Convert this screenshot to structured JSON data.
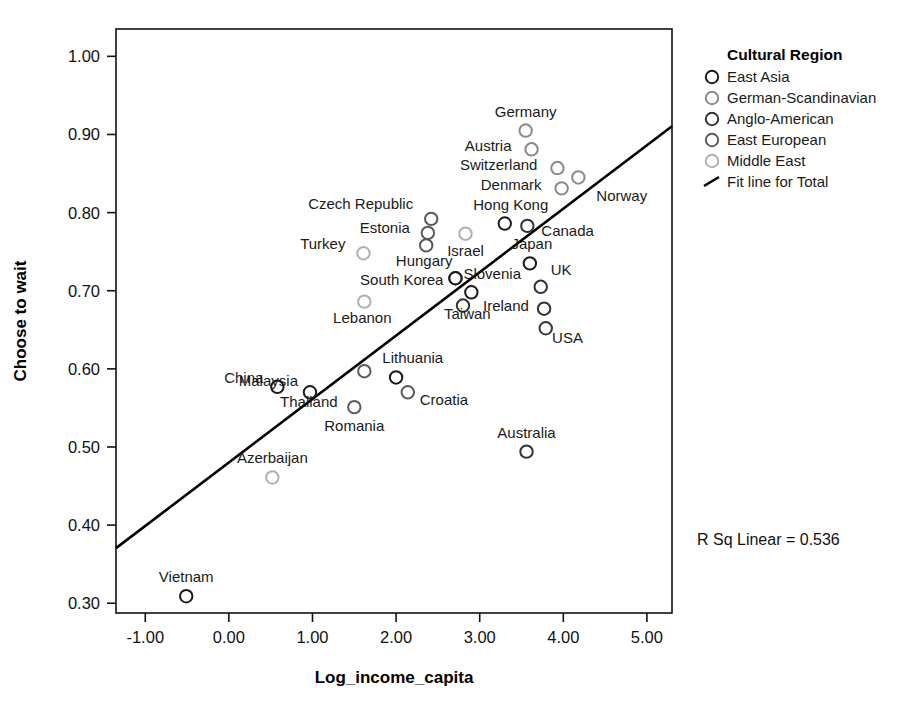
{
  "chart_data": {
    "type": "scatter",
    "title": "",
    "xlabel": "Log_income_capita",
    "ylabel": "Choose to wait",
    "xlim": [
      -1.35,
      5.3
    ],
    "ylim": [
      0.2875,
      1.035
    ],
    "xticks": [
      "-1.00",
      "0.00",
      "1.00",
      "2.00",
      "3.00",
      "4.00",
      "5.00"
    ],
    "xtick_values": [
      -1,
      0,
      1,
      2,
      3,
      4,
      5
    ],
    "yticks": [
      "0.30",
      "0.40",
      "0.50",
      "0.60",
      "0.70",
      "0.80",
      "0.90",
      "1.00"
    ],
    "ytick_values": [
      0.3,
      0.4,
      0.5,
      0.6,
      0.7,
      0.8,
      0.9,
      1.0
    ],
    "grid": false,
    "legend_position": "right",
    "annotation": "R Sq Linear = 0.536",
    "r_squared": 0.536,
    "fit_line": {
      "label": "Fit line for Total",
      "x_start": -1.35,
      "y_start": 0.3705,
      "x_end": 5.3,
      "y_end": 0.9105
    },
    "points": [
      {
        "label": "Germany",
        "x": 3.55,
        "y": 0.905,
        "group": "German-Scandinavian",
        "label_dx": 0,
        "label_dy": -14,
        "label_anchor": "middle"
      },
      {
        "label": "Austria",
        "x": 3.62,
        "y": 0.881,
        "group": "German-Scandinavian",
        "label_dx": -20,
        "label_dy": 2,
        "label_anchor": "end"
      },
      {
        "label": "Switzerland",
        "x": 3.93,
        "y": 0.857,
        "group": "German-Scandinavian",
        "label_dx": -20,
        "label_dy": 2,
        "label_anchor": "end"
      },
      {
        "label": "Norway",
        "x": 4.18,
        "y": 0.845,
        "group": "German-Scandinavian",
        "label_dx": 18,
        "label_dy": 24,
        "label_anchor": "start"
      },
      {
        "label": "Denmark",
        "x": 3.98,
        "y": 0.831,
        "group": "German-Scandinavian",
        "label_dx": -20,
        "label_dy": 2,
        "label_anchor": "end"
      },
      {
        "label": "Czech Republic",
        "x": 2.42,
        "y": 0.792,
        "group": "East European",
        "label_dx": -18,
        "label_dy": -10,
        "label_anchor": "end"
      },
      {
        "label": "Hong Kong",
        "x": 3.3,
        "y": 0.786,
        "group": "East Asia",
        "label_dx": 6,
        "label_dy": -14,
        "label_anchor": "middle"
      },
      {
        "label": "Canada",
        "x": 3.57,
        "y": 0.783,
        "group": "Anglo-American",
        "label_dx": 14,
        "label_dy": 10,
        "label_anchor": "start"
      },
      {
        "label": "Israel",
        "x": 2.83,
        "y": 0.773,
        "group": "Middle East",
        "label_dx": 0,
        "label_dy": 22,
        "label_anchor": "middle"
      },
      {
        "label": "Estonia",
        "x": 2.38,
        "y": 0.774,
        "group": "East European",
        "label_dx": -18,
        "label_dy": 0,
        "label_anchor": "end"
      },
      {
        "label": "Hungary",
        "x": 2.36,
        "y": 0.758,
        "group": "East European",
        "label_dx": -2,
        "label_dy": 21,
        "label_anchor": "middle"
      },
      {
        "label": "Turkey",
        "x": 1.61,
        "y": 0.748,
        "group": "Middle East",
        "label_dx": -18,
        "label_dy": -4,
        "label_anchor": "end"
      },
      {
        "label": "Japan",
        "x": 3.6,
        "y": 0.735,
        "group": "East Asia",
        "label_dx": 2,
        "label_dy": -14,
        "label_anchor": "middle"
      },
      {
        "label": "Slovenia",
        "x": 2.71,
        "y": 0.716,
        "group": "East European",
        "label_dx": 8,
        "label_dy": 1,
        "label_anchor": "start"
      },
      {
        "label": "South Korea",
        "x": 2.71,
        "y": 0.716,
        "group": "East Asia",
        "label_dx": -12,
        "label_dy": 7,
        "label_anchor": "end"
      },
      {
        "label": "UK",
        "x": 3.73,
        "y": 0.705,
        "group": "Anglo-American",
        "label_dx": 10,
        "label_dy": -12,
        "label_anchor": "start"
      },
      {
        "label": "Taiwan",
        "x": 2.9,
        "y": 0.698,
        "group": "East Asia",
        "label_dx": -4,
        "label_dy": 27,
        "label_anchor": "middle"
      },
      {
        "label": "Lebanon",
        "x": 1.62,
        "y": 0.686,
        "group": "Middle East",
        "label_dx": -2,
        "label_dy": 21,
        "label_anchor": "middle"
      },
      {
        "label": "Ireland",
        "x": 2.8,
        "y": 0.681,
        "group": "Anglo-American",
        "label_dx": 20,
        "label_dy": 5,
        "label_anchor": "start"
      },
      {
        "label": "USA",
        "x": 3.77,
        "y": 0.677,
        "group": "Anglo-American",
        "label_dx": 8,
        "label_dy": 34,
        "label_anchor": "start"
      },
      {
        "label": "",
        "x": 3.79,
        "y": 0.652,
        "group": "Anglo-American",
        "label_dx": 0,
        "label_dy": 0,
        "label_anchor": "middle"
      },
      {
        "label": "Lithuania",
        "x": 1.62,
        "y": 0.597,
        "group": "East European",
        "label_dx": 18,
        "label_dy": -8,
        "label_anchor": "start"
      },
      {
        "label": "Malaysia",
        "x": 0.97,
        "y": 0.57,
        "group": "East Asia",
        "label_dx": -12,
        "label_dy": -6,
        "label_anchor": "end"
      },
      {
        "label": "China",
        "x": 0.58,
        "y": 0.577,
        "group": "East Asia",
        "label_dx": -14,
        "label_dy": -4,
        "label_anchor": "end"
      },
      {
        "label": "Thailand",
        "x": 2.0,
        "y": 0.589,
        "group": "East Asia",
        "label_dx": -116,
        "label_dy": 30,
        "label_anchor": "start"
      },
      {
        "label": "Croatia",
        "x": 2.14,
        "y": 0.57,
        "group": "East European",
        "label_dx": 12,
        "label_dy": 13,
        "label_anchor": "start"
      },
      {
        "label": "Romania",
        "x": 1.5,
        "y": 0.551,
        "group": "East European",
        "label_dx": 0,
        "label_dy": 24,
        "label_anchor": "middle"
      },
      {
        "label": "Australia",
        "x": 3.56,
        "y": 0.494,
        "group": "Anglo-American",
        "label_dx": 0,
        "label_dy": -14,
        "label_anchor": "middle"
      },
      {
        "label": "Azerbaijan",
        "x": 0.52,
        "y": 0.461,
        "group": "Middle East",
        "label_dx": 0,
        "label_dy": -14,
        "label_anchor": "middle"
      },
      {
        "label": "Vietnam",
        "x": -0.51,
        "y": 0.309,
        "group": "East Asia",
        "label_dx": 0,
        "label_dy": -14,
        "label_anchor": "middle"
      }
    ],
    "legend": {
      "title": "Cultural Region",
      "entries": [
        {
          "label": "East Asia",
          "color": "#1a1a1a",
          "kind": "marker"
        },
        {
          "label": "German-Scandinavian",
          "color": "#8a8a8a",
          "kind": "marker"
        },
        {
          "label": "Anglo-American",
          "color": "#333333",
          "kind": "marker"
        },
        {
          "label": "East European",
          "color": "#5a5a5a",
          "kind": "marker"
        },
        {
          "label": "Middle East",
          "color": "#b0b0b0",
          "kind": "marker"
        },
        {
          "label": "Fit line for Total",
          "color": "#000000",
          "kind": "line"
        }
      ]
    },
    "group_colors": {
      "East Asia": "#1a1a1a",
      "German-Scandinavian": "#8a8a8a",
      "Anglo-American": "#333333",
      "East European": "#5a5a5a",
      "Middle East": "#b0b0b0"
    }
  }
}
